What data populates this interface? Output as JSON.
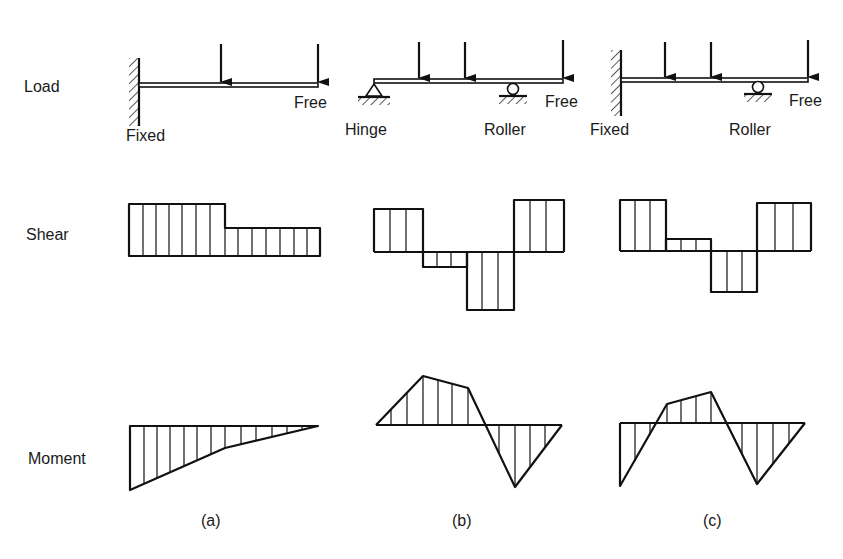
{
  "rows": {
    "load": "Load",
    "shear": "Shear",
    "moment": "Moment"
  },
  "cases": [
    {
      "id": "a",
      "caption": "(a)",
      "supports": {
        "left": "Fixed",
        "right": "Free"
      },
      "loads": 2
    },
    {
      "id": "b",
      "caption": "(b)",
      "supports": {
        "left": "Hinge",
        "middle": "Roller",
        "right": "Free"
      },
      "loads": 3
    },
    {
      "id": "c",
      "caption": "(c)",
      "supports": {
        "left": "Fixed",
        "middle": "Roller",
        "right": "Free"
      },
      "loads": 3
    }
  ],
  "colors": {
    "ink": "#111111",
    "background": "#ffffff"
  }
}
